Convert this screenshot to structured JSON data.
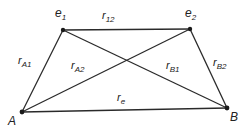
{
  "diagram": {
    "type": "quadrilateral-with-diagonals",
    "stroke_color": "#2a2a2a",
    "node_color": "#1a1a1a",
    "nodes": {
      "e1": {
        "label": "e",
        "sub": "1",
        "x": 63,
        "y": 30
      },
      "e2": {
        "label": "e",
        "sub": "2",
        "x": 190,
        "y": 29
      },
      "A": {
        "label": "A",
        "sub": "",
        "x": 22,
        "y": 112
      },
      "B": {
        "label": "B",
        "sub": "",
        "x": 227,
        "y": 108
      }
    },
    "edges": [
      {
        "id": "r12",
        "from": "e1",
        "to": "e2",
        "label": "r",
        "sub": "12"
      },
      {
        "id": "rA1",
        "from": "A",
        "to": "e1",
        "label": "r",
        "sub": "A1"
      },
      {
        "id": "rA2",
        "from": "A",
        "to": "e2",
        "label": "r",
        "sub": "A2"
      },
      {
        "id": "rB1",
        "from": "B",
        "to": "e1",
        "label": "r",
        "sub": "B1"
      },
      {
        "id": "rB2",
        "from": "B",
        "to": "e2",
        "label": "r",
        "sub": "B2"
      },
      {
        "id": "re",
        "from": "A",
        "to": "B",
        "label": "r",
        "sub": "e"
      }
    ]
  }
}
